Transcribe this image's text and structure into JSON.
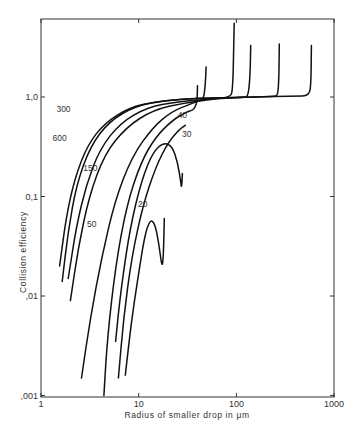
{
  "chart_data": {
    "type": "line",
    "title": "",
    "xlabel": "Radius of smaller drop in μm",
    "ylabel": "Collision efficiency",
    "xscale": "log",
    "yscale": "log",
    "xlim": [
      1,
      1000
    ],
    "ylim": [
      0.001,
      6
    ],
    "grid": false,
    "x_ticks": [
      {
        "value": 1,
        "label": "1"
      },
      {
        "value": 10,
        "label": "10"
      },
      {
        "value": 100,
        "label": "100"
      },
      {
        "value": 1000,
        "label": "1000"
      }
    ],
    "y_ticks": [
      {
        "value": 1.0,
        "label": "1,0"
      },
      {
        "value": 0.1,
        "label": "0,1"
      },
      {
        "value": 0.01,
        "label": ",01"
      },
      {
        "value": 0.001,
        "label": ",001"
      }
    ],
    "series": [
      {
        "name": "600",
        "label_pos": [
          1.55,
          0.36
        ],
        "points": [
          [
            1.55,
            0.02
          ],
          [
            1.8,
            0.06
          ],
          [
            2.2,
            0.15
          ],
          [
            3,
            0.33
          ],
          [
            4.5,
            0.55
          ],
          [
            8,
            0.78
          ],
          [
            15,
            0.9
          ],
          [
            30,
            0.96
          ],
          [
            60,
            0.98
          ],
          [
            150,
            1.0
          ],
          [
            400,
            1.02
          ],
          [
            560,
            1.03
          ],
          [
            580,
            1.4
          ],
          [
            585,
            3.3
          ]
        ]
      },
      {
        "name": "300",
        "label_pos": [
          1.7,
          0.7
        ],
        "points": [
          [
            1.65,
            0.014
          ],
          [
            1.9,
            0.045
          ],
          [
            2.3,
            0.13
          ],
          [
            3.2,
            0.32
          ],
          [
            5,
            0.57
          ],
          [
            9,
            0.8
          ],
          [
            18,
            0.92
          ],
          [
            40,
            0.97
          ],
          [
            100,
            0.99
          ],
          [
            240,
            1.01
          ],
          [
            265,
            1.03
          ],
          [
            272,
            1.5
          ],
          [
            275,
            3.4
          ]
        ]
      },
      {
        "name": "150",
        "label_pos": [
          3.2,
          0.18
        ],
        "points": [
          [
            1.9,
            0.015
          ],
          [
            2.3,
            0.05
          ],
          [
            2.9,
            0.13
          ],
          [
            4,
            0.3
          ],
          [
            6.5,
            0.55
          ],
          [
            12,
            0.78
          ],
          [
            25,
            0.9
          ],
          [
            60,
            0.96
          ],
          [
            120,
            0.99
          ],
          [
            132,
            1.02
          ],
          [
            138,
            1.6
          ],
          [
            140,
            3.3
          ]
        ]
      },
      {
        "name": "100",
        "label_pos": null,
        "points": [
          [
            2.0,
            0.009
          ],
          [
            2.4,
            0.03
          ],
          [
            3.1,
            0.1
          ],
          [
            4.5,
            0.27
          ],
          [
            7.5,
            0.5
          ],
          [
            14,
            0.74
          ],
          [
            30,
            0.88
          ],
          [
            60,
            0.95
          ],
          [
            86,
            1.0
          ],
          [
            92,
            1.15
          ],
          [
            95,
            5.5
          ]
        ]
      },
      {
        "name": "50",
        "label_pos": [
          3.3,
          0.049
        ],
        "points": [
          [
            2.6,
            0.0015
          ],
          [
            3.2,
            0.006
          ],
          [
            4.2,
            0.025
          ],
          [
            5.7,
            0.09
          ],
          [
            8.5,
            0.25
          ],
          [
            14,
            0.5
          ],
          [
            22,
            0.72
          ],
          [
            35,
            0.86
          ],
          [
            42,
            0.92
          ],
          [
            46,
            0.95
          ],
          [
            48,
            1.3
          ],
          [
            49,
            2.0
          ]
        ]
      },
      {
        "name": "40",
        "label_pos": [
          28,
          0.62
        ],
        "points": [
          [
            4.4,
            0.001
          ],
          [
            4.8,
            0.004
          ],
          [
            5.8,
            0.02
          ],
          [
            7.5,
            0.08
          ],
          [
            10.5,
            0.22
          ],
          [
            15,
            0.4
          ],
          [
            22,
            0.58
          ],
          [
            30,
            0.7
          ],
          [
            36,
            0.74
          ],
          [
            38,
            0.8
          ],
          [
            39.5,
            0.9
          ],
          [
            40,
            1.3
          ]
        ]
      },
      {
        "name": "30",
        "label_pos": [
          31,
          0.4
        ],
        "points": [
          [
            5.8,
            0.0035
          ],
          [
            6.6,
            0.012
          ],
          [
            8.2,
            0.05
          ],
          [
            10.8,
            0.15
          ],
          [
            14,
            0.28
          ],
          [
            18,
            0.35
          ],
          [
            22,
            0.32
          ],
          [
            25,
            0.22
          ],
          [
            27,
            0.14
          ],
          [
            27.5,
            0.12
          ],
          [
            28,
            0.17
          ]
        ]
      },
      {
        "name": "30b",
        "label_pos": null,
        "points": [
          [
            6.2,
            0.0015
          ],
          [
            7.0,
            0.006
          ],
          [
            8.5,
            0.025
          ],
          [
            11,
            0.08
          ],
          [
            15,
            0.2
          ],
          [
            20,
            0.35
          ],
          [
            26,
            0.47
          ],
          [
            30,
            0.52
          ]
        ]
      },
      {
        "name": "20",
        "label_pos": [
          11,
          0.078
        ],
        "points": [
          [
            7.3,
            0.0016
          ],
          [
            8.3,
            0.005
          ],
          [
            9.8,
            0.015
          ],
          [
            11.5,
            0.04
          ],
          [
            13,
            0.058
          ],
          [
            14.5,
            0.055
          ],
          [
            16,
            0.035
          ],
          [
            17.2,
            0.02
          ],
          [
            17.8,
            0.022
          ],
          [
            18.3,
            0.06
          ]
        ]
      }
    ]
  }
}
